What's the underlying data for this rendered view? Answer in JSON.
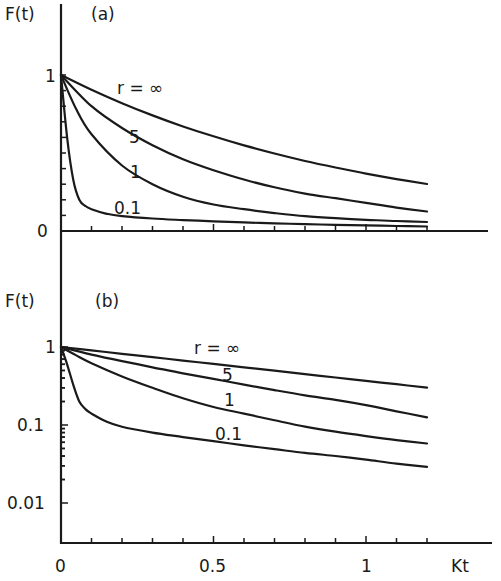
{
  "chart_data": [
    {
      "panel": "(a)",
      "type": "line",
      "ylabel": "F(t)",
      "xlabel": "Kt",
      "yscale": "linear",
      "ylim": [
        0,
        1
      ],
      "xlim": [
        0,
        1.3
      ],
      "yticks": [
        {
          "value": 0,
          "label": "0"
        },
        {
          "value": 1,
          "label": "1"
        }
      ],
      "xticks": [],
      "grid": false,
      "series": [
        {
          "name": "r = ∞",
          "label": "r = ∞",
          "x": [
            0,
            0.1,
            0.2,
            0.3,
            0.4,
            0.5,
            0.6,
            0.7,
            0.8,
            0.9,
            1.0,
            1.1,
            1.2
          ],
          "values": [
            1,
            0.905,
            0.819,
            0.741,
            0.67,
            0.607,
            0.549,
            0.497,
            0.449,
            0.407,
            0.368,
            0.333,
            0.301
          ]
        },
        {
          "name": "r = 5",
          "label": "5",
          "x": [
            0,
            0.1,
            0.2,
            0.3,
            0.4,
            0.5,
            0.6,
            0.7,
            0.8,
            0.9,
            1.0,
            1.1,
            1.2
          ],
          "values": [
            1,
            0.8,
            0.66,
            0.55,
            0.46,
            0.39,
            0.33,
            0.28,
            0.24,
            0.21,
            0.18,
            0.15,
            0.125
          ]
        },
        {
          "name": "r = 1",
          "label": "1",
          "x": [
            0,
            0.05,
            0.1,
            0.2,
            0.3,
            0.4,
            0.5,
            0.6,
            0.7,
            0.8,
            0.9,
            1.0,
            1.1,
            1.2
          ],
          "values": [
            1,
            0.78,
            0.62,
            0.42,
            0.3,
            0.22,
            0.17,
            0.14,
            0.115,
            0.095,
            0.082,
            0.072,
            0.064,
            0.058
          ]
        },
        {
          "name": "r = 0.1",
          "label": "0.1",
          "x": [
            0,
            0.02,
            0.04,
            0.06,
            0.08,
            0.1,
            0.15,
            0.2,
            0.3,
            0.4,
            0.5,
            0.6,
            0.7,
            0.8,
            0.9,
            1.0,
            1.1,
            1.2
          ],
          "values": [
            1,
            0.6,
            0.33,
            0.2,
            0.16,
            0.14,
            0.11,
            0.095,
            0.08,
            0.07,
            0.062,
            0.055,
            0.049,
            0.044,
            0.04,
            0.036,
            0.032,
            0.029
          ]
        }
      ]
    },
    {
      "panel": "(b)",
      "type": "line",
      "ylabel": "F(t)",
      "xlabel": "Kt",
      "yscale": "log",
      "ylim": [
        0.005,
        1.6
      ],
      "xlim": [
        0,
        1.3
      ],
      "yticks": [
        {
          "value": 1,
          "label": "1"
        },
        {
          "value": 0.1,
          "label": "0.1"
        },
        {
          "value": 0.01,
          "label": "0.01"
        }
      ],
      "xticks": [
        {
          "value": 0,
          "label": "0"
        },
        {
          "value": 0.5,
          "label": "0.5"
        },
        {
          "value": 1,
          "label": "1"
        }
      ],
      "grid": false,
      "series": [
        {
          "name": "r = ∞",
          "label": "r = ∞",
          "x": [
            0,
            0.1,
            0.2,
            0.3,
            0.4,
            0.5,
            0.6,
            0.7,
            0.8,
            0.9,
            1.0,
            1.1,
            1.2
          ],
          "values": [
            1,
            0.905,
            0.819,
            0.741,
            0.67,
            0.607,
            0.549,
            0.497,
            0.449,
            0.407,
            0.368,
            0.333,
            0.301
          ]
        },
        {
          "name": "r = 5",
          "label": "5",
          "x": [
            0,
            0.1,
            0.2,
            0.3,
            0.4,
            0.5,
            0.6,
            0.7,
            0.8,
            0.9,
            1.0,
            1.1,
            1.2
          ],
          "values": [
            1,
            0.8,
            0.66,
            0.55,
            0.46,
            0.39,
            0.33,
            0.28,
            0.24,
            0.21,
            0.18,
            0.15,
            0.125
          ]
        },
        {
          "name": "r = 1",
          "label": "1",
          "x": [
            0,
            0.05,
            0.1,
            0.2,
            0.3,
            0.4,
            0.5,
            0.6,
            0.7,
            0.8,
            0.9,
            1.0,
            1.1,
            1.2
          ],
          "values": [
            1,
            0.78,
            0.62,
            0.42,
            0.3,
            0.22,
            0.17,
            0.14,
            0.115,
            0.095,
            0.082,
            0.072,
            0.064,
            0.058
          ]
        },
        {
          "name": "r = 0.1",
          "label": "0.1",
          "x": [
            0,
            0.02,
            0.04,
            0.06,
            0.08,
            0.1,
            0.15,
            0.2,
            0.3,
            0.4,
            0.5,
            0.6,
            0.7,
            0.8,
            0.9,
            1.0,
            1.1,
            1.2
          ],
          "values": [
            1,
            0.6,
            0.33,
            0.2,
            0.16,
            0.14,
            0.11,
            0.095,
            0.08,
            0.07,
            0.062,
            0.055,
            0.049,
            0.044,
            0.04,
            0.036,
            0.032,
            0.029
          ]
        }
      ]
    }
  ],
  "panels": {
    "a": {
      "ylabel": "F(t)",
      "tag": "(a)",
      "ytick_1": "1",
      "ytick_0": "0",
      "labels": {
        "inf": "r = ∞",
        "five": "5",
        "one": "1",
        "tenth": "0.1"
      }
    },
    "b": {
      "ylabel": "F(t)",
      "tag": "(b)",
      "ytick_1": "1",
      "ytick_01": "0.1",
      "ytick_001": "0.01",
      "labels": {
        "inf": "r = ∞",
        "five": "5",
        "one": "1",
        "tenth": "0.1"
      }
    }
  },
  "xaxis": {
    "tick_0": "0",
    "tick_05": "0.5",
    "tick_1": "1",
    "label": "Kt"
  }
}
